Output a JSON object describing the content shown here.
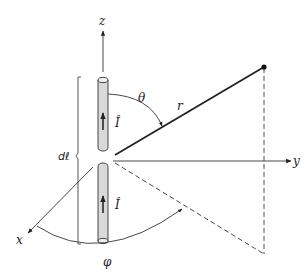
{
  "diagram": {
    "labels": {
      "z_axis": "z",
      "y_axis": "y",
      "x_axis": "x",
      "theta": "θ",
      "phi": "φ",
      "r": "r",
      "current_upper": "Î",
      "current_lower": "Î",
      "element_length": "dℓ"
    },
    "elements": [
      {
        "id": "z-axis",
        "type": "axis",
        "label": "z"
      },
      {
        "id": "y-axis",
        "type": "axis",
        "label": "y"
      },
      {
        "id": "x-axis",
        "type": "axis",
        "label": "x"
      },
      {
        "id": "upper-rod",
        "type": "conductor",
        "current_direction": "up"
      },
      {
        "id": "lower-rod",
        "type": "conductor",
        "current_direction": "up"
      },
      {
        "id": "radius-vector",
        "type": "line",
        "label": "r"
      },
      {
        "id": "field-point",
        "type": "point"
      },
      {
        "id": "theta-arc",
        "type": "angle",
        "label": "θ"
      },
      {
        "id": "phi-arc",
        "type": "angle",
        "label": "φ"
      },
      {
        "id": "length-bracket",
        "type": "dimension",
        "label": "dℓ"
      },
      {
        "id": "projection-vertical",
        "type": "dashed-line"
      },
      {
        "id": "projection-xy",
        "type": "dashed-line"
      }
    ],
    "colors": {
      "line": "#222222",
      "rod_fill": "#d9d9d9",
      "background": "#ffffff"
    }
  }
}
